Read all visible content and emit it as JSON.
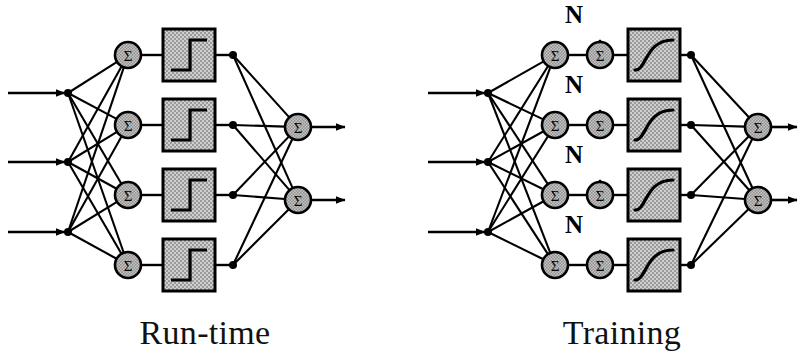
{
  "figure": {
    "background_color": "#ffffff",
    "ink_color": "#000000",
    "box_fill_color": "#b9b9b9",
    "node_fill_color": "#a8a8a8"
  },
  "panels": [
    {
      "id": "run-time",
      "caption": "Run-time",
      "caption_x": 205,
      "caption_y": 344,
      "origin_x": 0,
      "activation": {
        "type": "step",
        "name": "hard-threshold-step-function",
        "label": ""
      },
      "has_noise_injection": false,
      "inputs": [
        {
          "label": "",
          "y": 93
        },
        {
          "label": "",
          "y": 162
        },
        {
          "label": "",
          "y": 232
        }
      ],
      "hidden_units": [
        {
          "label": "Σ",
          "y": 55
        },
        {
          "label": "Σ",
          "y": 125
        },
        {
          "label": "Σ",
          "y": 195
        },
        {
          "label": "Σ",
          "y": 265
        }
      ],
      "outputs": [
        {
          "label": "Σ",
          "y": 127
        },
        {
          "label": "Σ",
          "y": 200
        }
      ],
      "geometry": {
        "input_arrow_start_x": 8,
        "input_node_x": 68,
        "hidden_node_x": 128,
        "box_x": 163,
        "box_size": 52,
        "tap_node_x": 233,
        "output_node_x": 298,
        "output_arrow_end_x": 345,
        "node_radius": 13,
        "dot_radius": 4
      }
    },
    {
      "id": "training",
      "caption": "Training",
      "caption_x": 622,
      "caption_y": 344,
      "origin_x": 420,
      "activation": {
        "type": "sigmoid",
        "name": "sigmoid-squashing-function",
        "label": ""
      },
      "has_noise_injection": true,
      "noise_label": "N",
      "inputs": [
        {
          "label": "",
          "y": 93
        },
        {
          "label": "",
          "y": 162
        },
        {
          "label": "",
          "y": 232
        }
      ],
      "hidden_units": [
        {
          "label": "Σ",
          "y": 55
        },
        {
          "label": "Σ",
          "y": 125
        },
        {
          "label": "Σ",
          "y": 195
        },
        {
          "label": "Σ",
          "y": 265
        }
      ],
      "noise_adders": [
        {
          "label": "Σ",
          "y": 55,
          "noise_label": "N"
        },
        {
          "label": "Σ",
          "y": 125,
          "noise_label": "N"
        },
        {
          "label": "Σ",
          "y": 195,
          "noise_label": "N"
        },
        {
          "label": "Σ",
          "y": 265,
          "noise_label": "N"
        }
      ],
      "outputs": [
        {
          "label": "Σ",
          "y": 127
        },
        {
          "label": "Σ",
          "y": 200
        }
      ],
      "geometry": {
        "input_arrow_start_x": 428,
        "input_node_x": 488,
        "hidden_node_x": 555,
        "noise_node_x": 600,
        "box_x": 628,
        "box_size": 52,
        "tap_node_x": 691,
        "output_node_x": 758,
        "output_arrow_end_x": 797,
        "node_radius": 13,
        "dot_radius": 4,
        "noise_label_dy": -40,
        "noise_arrow_top_dy": -45
      }
    }
  ],
  "legend": {
    "sigma_symbol": "Σ",
    "noise_symbol": "N"
  }
}
